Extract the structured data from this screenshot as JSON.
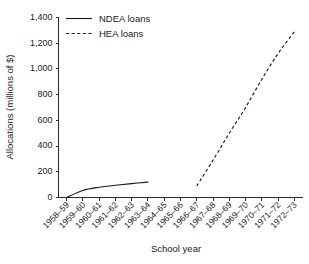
{
  "chart_data": {
    "type": "line",
    "title": "",
    "xlabel": "School year",
    "ylabel": "Allocations (millions of $)",
    "categories": [
      "1958–59",
      "1959–60",
      "1960–61",
      "1961–62",
      "1962–63",
      "1963–64",
      "1964–65",
      "1965–66",
      "1966–67",
      "1967–68",
      "1968–69",
      "1969–70",
      "1970–71",
      "1971–72",
      "1972–73"
    ],
    "ylim": [
      0,
      1400
    ],
    "ytick_values": [
      0,
      200,
      400,
      600,
      800,
      1000,
      1200,
      1400
    ],
    "ytick_labels": [
      "0",
      "200",
      "400",
      "600",
      "800",
      "1,000",
      "1,200",
      "1,400"
    ],
    "grid": false,
    "legend_position": "top-center-inside",
    "series": [
      {
        "name": "NDEA loans",
        "style": "solid",
        "color": "#1a1a1a",
        "x": [
          "1958–59",
          "1959–60",
          "1960–61",
          "1961–62",
          "1962–63",
          "1963–64"
        ],
        "values": [
          0,
          55,
          80,
          95,
          108,
          120
        ]
      },
      {
        "name": "HEA loans",
        "style": "dashed",
        "color": "#1a1a1a",
        "x": [
          "1966–67",
          "1967–68",
          "1968–69",
          "1969–70",
          "1970–71",
          "1971–72",
          "1972–73"
        ],
        "values": [
          90,
          290,
          500,
          700,
          920,
          1120,
          1290
        ]
      }
    ]
  },
  "legend": {
    "items": [
      {
        "label": "NDEA loans",
        "style": "solid"
      },
      {
        "label": "HEA loans",
        "style": "dashed"
      }
    ]
  }
}
